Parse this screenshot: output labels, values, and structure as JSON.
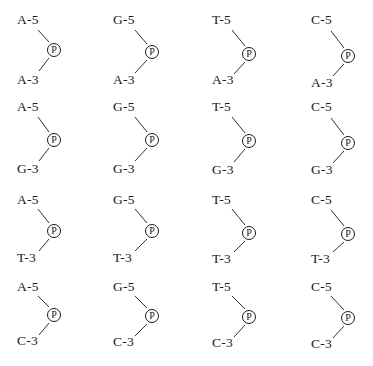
{
  "diagram": {
    "type": "dinucleotide-phosphate-grid",
    "phosphate_label": "P",
    "rows": [
      {
        "three_prime": "A-3",
        "cells": [
          {
            "five_prime": "A-5",
            "three_prime": "A-3"
          },
          {
            "five_prime": "G-5",
            "three_prime": "A-3"
          },
          {
            "five_prime": "T-5",
            "three_prime": "A-3"
          },
          {
            "five_prime": "C-5",
            "three_prime": "A-3"
          }
        ]
      },
      {
        "three_prime": "G-3",
        "cells": [
          {
            "five_prime": "A-5",
            "three_prime": "G-3"
          },
          {
            "five_prime": "G-5",
            "three_prime": "G-3"
          },
          {
            "five_prime": "T-5",
            "three_prime": "G-3"
          },
          {
            "five_prime": "C-5",
            "three_prime": "G-3"
          }
        ]
      },
      {
        "three_prime": "T-3",
        "cells": [
          {
            "five_prime": "A-5",
            "three_prime": "T-3"
          },
          {
            "five_prime": "G-5",
            "three_prime": "T-3"
          },
          {
            "five_prime": "T-5",
            "three_prime": "T-3"
          },
          {
            "five_prime": "C-5",
            "three_prime": "T-3"
          }
        ]
      },
      {
        "three_prime": "C-3",
        "cells": [
          {
            "five_prime": "A-5",
            "three_prime": "C-3"
          },
          {
            "five_prime": "G-5",
            "three_prime": "C-3"
          },
          {
            "five_prime": "T-5",
            "three_prime": "C-3"
          },
          {
            "five_prime": "C-5",
            "three_prime": "C-3"
          }
        ]
      }
    ]
  },
  "style": {
    "ink_color": "#1a1a1a",
    "background": "#ffffff"
  }
}
